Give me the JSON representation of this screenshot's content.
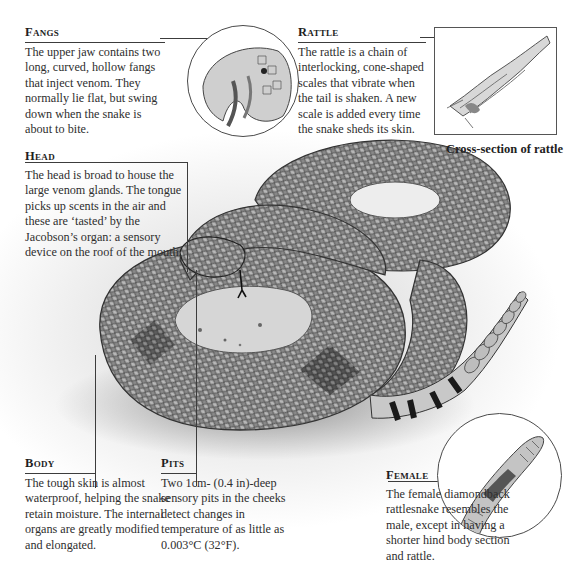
{
  "diagram": {
    "subject": "Diamondback rattlesnake",
    "annotations": {
      "fangs": {
        "title": "Fangs",
        "body": "The upper jaw contains two long, curved, hollow fangs that inject venom. They normally lie flat, but swing down when the snake is about to bite."
      },
      "rattle": {
        "title": "Rattle",
        "body": "The rattle is a chain of interlocking, cone-shaped scales that vibrate when the tail is shaken. A new scale is added every time the snake sheds its skin."
      },
      "head": {
        "title": "Head",
        "body": "The head is broad to house the large venom glands. The tongue picks up scents in the air and these are ‘tasted’ by the Jacobson’s organ: a sensory device on the roof of the mouth."
      },
      "body": {
        "title": "Body",
        "body": "The tough skin is almost waterproof, helping the snake retain moisture. The internal organs are greatly modified and elongated."
      },
      "pits": {
        "title": "Pits",
        "body": "Two 1cm- (0.4 in)-deep sensory pits in the cheeks detect changes in temperature of as little as 0.003°C (32°F)."
      },
      "female": {
        "title": "Female",
        "body": "The female diamondback rattlesnake resembles the male, except in having a shorter hind body section and rattle."
      }
    },
    "insets": {
      "rattle_cross_section_caption": "Cross-section of rattle"
    },
    "colors": {
      "text": "#2e2e2e",
      "lines": "#3c3c3c",
      "background": "#ffffff",
      "snake_dark": "#3a3a3a",
      "snake_light": "#a8a8a8"
    }
  }
}
